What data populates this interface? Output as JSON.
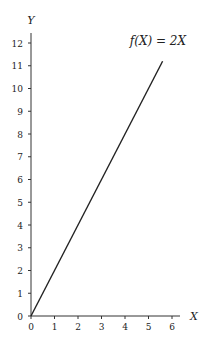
{
  "chart_data": {
    "type": "line",
    "title": "",
    "annotation": "f(X) = 2X",
    "xlabel": "X",
    "ylabel": "Y",
    "xlim": [
      0,
      6
    ],
    "ylim": [
      0,
      12
    ],
    "x_ticks": [
      "0",
      "1",
      "2",
      "3",
      "4",
      "5",
      "6"
    ],
    "y_ticks": [
      "0",
      "1",
      "2",
      "3",
      "4",
      "5",
      "6",
      "7",
      "8",
      "9",
      "10",
      "11",
      "12"
    ],
    "grid": false,
    "series": [
      {
        "name": "f(X) = 2X",
        "x": [
          0,
          5.6
        ],
        "y": [
          0,
          11.2
        ]
      }
    ],
    "line_color": "#222222"
  }
}
